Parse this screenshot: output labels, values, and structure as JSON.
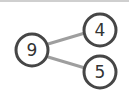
{
  "diagram": {
    "type": "number-bond",
    "whole": {
      "label": "9",
      "cx": 32,
      "cy": 50,
      "r": 16
    },
    "parts": [
      {
        "label": "4",
        "cx": 100,
        "cy": 30,
        "r": 16
      },
      {
        "label": "5",
        "cx": 100,
        "cy": 72,
        "r": 16
      }
    ],
    "colors": {
      "circle_stroke": "#464646",
      "circle_fill": "#ffffff",
      "connector": "#9e9e9e",
      "text": "#333333"
    }
  }
}
